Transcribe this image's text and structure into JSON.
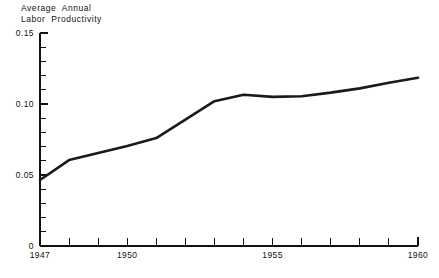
{
  "chart_data": {
    "type": "line",
    "title_line1": "Average  Annual",
    "title_line2": "Labor  Productivity",
    "xlabel": "",
    "ylabel": "Average Annual Labor Productivity",
    "xlim": [
      1947,
      1960
    ],
    "ylim": [
      0,
      0.15
    ],
    "grid": false,
    "legend": false,
    "line_color": "#1a1a1a",
    "line_width": 2.6,
    "axis_color": "#111111",
    "background": "#ffffff",
    "x": [
      1947,
      1948,
      1949,
      1950,
      1951,
      1952,
      1953,
      1954,
      1955,
      1956,
      1957,
      1958,
      1959,
      1960
    ],
    "values": [
      0.0465,
      0.0605,
      0.0655,
      0.0705,
      0.076,
      0.089,
      0.102,
      0.1065,
      0.105,
      0.1055,
      0.108,
      0.111,
      0.115,
      0.1185
    ],
    "x_ticks": [
      1947,
      1948,
      1949,
      1950,
      1951,
      1952,
      1953,
      1954,
      1955,
      1956,
      1957,
      1958,
      1959,
      1960
    ],
    "x_tick_labels": [
      "1947",
      "",
      "",
      "1950",
      "",
      "",
      "",
      "",
      "1955",
      "",
      "",
      "",
      "",
      "1960"
    ],
    "y_ticks": [
      0,
      0.01,
      0.02,
      0.03,
      0.04,
      0.05,
      0.06,
      0.07,
      0.08,
      0.09,
      0.1,
      0.11,
      0.12,
      0.13,
      0.14,
      0.15
    ],
    "y_tick_labels": [
      "0",
      "",
      "",
      "",
      "",
      "0.05",
      "",
      "",
      "",
      "",
      "0.10",
      "",
      "",
      "",
      "",
      "0.15"
    ],
    "y_major_labels": [
      {
        "value": 0.15,
        "text": "0.15"
      },
      {
        "value": 0.1,
        "text": "0.10"
      },
      {
        "value": 0.05,
        "text": "0.05"
      },
      {
        "value": 0.0,
        "text": "0"
      }
    ],
    "x_major_labels": [
      {
        "value": 1947,
        "text": "1947"
      },
      {
        "value": 1950,
        "text": "1950"
      },
      {
        "value": 1955,
        "text": "1955"
      },
      {
        "value": 1960,
        "text": "1960"
      }
    ]
  }
}
